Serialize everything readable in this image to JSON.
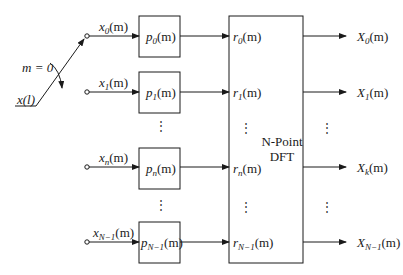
{
  "diagram": {
    "title": "",
    "switch": {
      "input_label": "x(l)",
      "position_label": "m = 0"
    },
    "branches": [
      {
        "input": {
          "base": "x",
          "sub": "0",
          "arg": "(m)"
        },
        "filter": {
          "base": "p",
          "sub": "0",
          "arg": "(m)"
        },
        "dft_in": {
          "base": "r",
          "sub": "0",
          "arg": "(m)"
        },
        "output": {
          "base": "X",
          "sub": "0",
          "arg": "(m)"
        }
      },
      {
        "input": {
          "base": "x",
          "sub": "1",
          "arg": "(m)"
        },
        "filter": {
          "base": "p",
          "sub": "1",
          "arg": "(m)"
        },
        "dft_in": {
          "base": "r",
          "sub": "1",
          "arg": "(m)"
        },
        "output": {
          "base": "X",
          "sub": "1",
          "arg": "(m)"
        }
      },
      {
        "input": {
          "base": "x",
          "sub": "n",
          "arg": "(m)"
        },
        "filter": {
          "base": "p",
          "sub": "n",
          "arg": "(m)"
        },
        "dft_in": {
          "base": "r",
          "sub": "n",
          "arg": "(m)"
        },
        "output": {
          "base": "X",
          "sub": "k",
          "arg": "(m)"
        }
      },
      {
        "input": {
          "base": "x",
          "sub": "N−1",
          "arg": "(m)"
        },
        "filter": {
          "base": "p",
          "sub": "N−1",
          "arg": "(m)"
        },
        "dft_in": {
          "base": "r",
          "sub": "N−1",
          "arg": "(m)"
        },
        "output": {
          "base": "X",
          "sub": "N−1",
          "arg": "(m)"
        }
      }
    ],
    "dft_block": {
      "line1": "N-Point",
      "line2": "DFT"
    },
    "ellipsis": "⋮",
    "colors": {
      "line": "#1a1a1a",
      "background": "#ffffff"
    }
  }
}
